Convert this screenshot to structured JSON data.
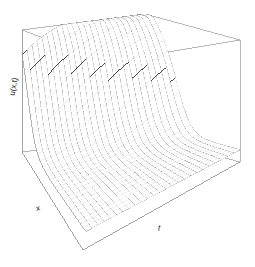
{
  "figure": {
    "type": "persp-3d-surface",
    "background_color": "#ffffff",
    "line_color": "#4d4d4d",
    "box_color": "#9a9a9a",
    "label_color": "#1a1a1a",
    "width": 255,
    "height": 267
  },
  "labels": {
    "x_axis": "x",
    "t_axis": "t",
    "z_axis": "u(x,t)"
  },
  "chart_data": {
    "type": "surface",
    "title": "",
    "xlabel": "x",
    "ylabel": "t",
    "zlabel": "u(x,t)",
    "grid": false,
    "legend": false,
    "tick_labels": {
      "x": [],
      "t": [],
      "z": []
    },
    "xlim": [
      0,
      1
    ],
    "ylim": [
      0,
      1
    ],
    "zlim": [
      0,
      1
    ],
    "nx": 26,
    "nt": 26,
    "surface_model": {
      "description": "travelling shock front: u decays steeply near x=0 and relaxes to a flat plateau as t grows",
      "formula": "u = exp(-a*x) * (1 - tanh(b*(x - c - s*t))) / 2 + plateau",
      "a": 1.1,
      "b": 7.0,
      "c": 0.06,
      "s": 0.3,
      "plateau": 0.1,
      "front_sharpness": 7.0
    },
    "view": {
      "theta": 318,
      "phi": 22,
      "d": 3.2,
      "expand": 0.58,
      "ticktype": "simple",
      "box": true,
      "shade": 0
    },
    "box_corners_px": {
      "top_left": [
        22,
        30
      ],
      "top_back": [
        145,
        14
      ],
      "top_right": [
        240,
        40
      ],
      "top_front": [
        108,
        62
      ],
      "bottom_left": [
        22,
        152
      ],
      "bottom_back": [
        145,
        136
      ],
      "bottom_right": [
        240,
        162
      ],
      "bottom_front": [
        108,
        184
      ],
      "floor_front": [
        83,
        250
      ]
    }
  }
}
